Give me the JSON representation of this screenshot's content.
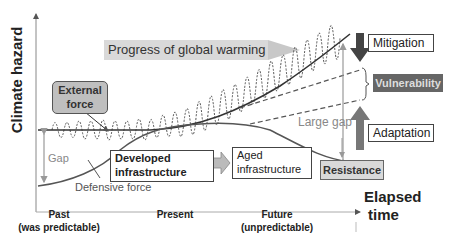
{
  "axes": {
    "y_label": "Climate hazard",
    "x_label_line1": "Elapsed",
    "x_label_line2": "time"
  },
  "banner": {
    "label": "Progress of global warming"
  },
  "boxes": {
    "external_force": "External force",
    "developed_infrastructure": "Developed infrastructure",
    "aged_infrastructure": "Aged infrastructure",
    "mitigation": "Mitigation",
    "vulnerability": "Vulnerability",
    "adaptation": "Adaptation",
    "resistance": "Resistance"
  },
  "labels": {
    "gap": "Gap",
    "large_gap": "Large gap",
    "defensive_force": "Defensive force"
  },
  "x_ticks": [
    {
      "line1": "Past",
      "line2": "(was predictable)"
    },
    {
      "line1": "Present",
      "line2": ""
    },
    {
      "line1": "Future",
      "line2": "(unpredictable)"
    }
  ],
  "colors": {
    "banner_fill": "#d9d9d9",
    "external_force_fill": "#bfbfbf",
    "vulnerability_fill": "#666666",
    "resistance_fill": "#d9d9d9",
    "arrow_dark": "#444444",
    "arrow_mid": "#777777",
    "gap_arrow": "#999999"
  }
}
